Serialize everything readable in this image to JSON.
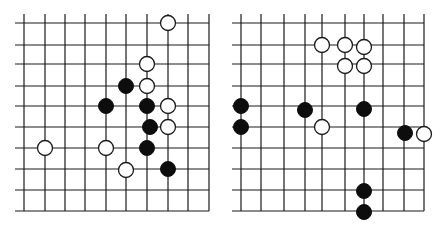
{
  "background": "#ffffff",
  "line_color": "#1a1a1a",
  "black_color": "#0d0d0d",
  "white_color": "#ffffff",
  "stone_radius": 7.5,
  "boards": [
    {
      "name": "left-board",
      "x_lines": [
        24,
        45,
        65,
        85,
        106,
        126,
        147,
        168,
        188,
        209
      ],
      "y_lines": [
        23,
        45,
        64,
        86,
        106,
        127,
        148,
        169,
        190,
        211
      ],
      "h_line_x_extent": [
        15,
        209
      ],
      "v_line_y_extent": [
        14,
        211
      ],
      "stones": [
        {
          "color": "white",
          "x": 168,
          "y": 23
        },
        {
          "color": "white",
          "x": 147,
          "y": 64
        },
        {
          "color": "black",
          "x": 126,
          "y": 86
        },
        {
          "color": "white",
          "x": 147,
          "y": 86
        },
        {
          "color": "black",
          "x": 106,
          "y": 106
        },
        {
          "color": "black",
          "x": 147,
          "y": 106
        },
        {
          "color": "white",
          "x": 168,
          "y": 106
        },
        {
          "color": "black",
          "x": 150,
          "y": 127
        },
        {
          "color": "white",
          "x": 168,
          "y": 127
        },
        {
          "color": "white",
          "x": 45,
          "y": 148
        },
        {
          "color": "white",
          "x": 106,
          "y": 148
        },
        {
          "color": "black",
          "x": 147,
          "y": 148
        },
        {
          "color": "white",
          "x": 126,
          "y": 170
        },
        {
          "color": "black",
          "x": 168,
          "y": 169
        }
      ]
    },
    {
      "name": "right-board",
      "x_lines": [
        241,
        261,
        284,
        305,
        322,
        345,
        364,
        383,
        404,
        424
      ],
      "y_lines": [
        23,
        45,
        64,
        86,
        106,
        127,
        148,
        169,
        190,
        211
      ],
      "h_line_x_extent": [
        232,
        424
      ],
      "v_line_y_extent": [
        14,
        211
      ],
      "stones": [
        {
          "color": "white",
          "x": 322,
          "y": 45
        },
        {
          "color": "white",
          "x": 345,
          "y": 45
        },
        {
          "color": "white",
          "x": 364,
          "y": 47
        },
        {
          "color": "white",
          "x": 345,
          "y": 66
        },
        {
          "color": "white",
          "x": 364,
          "y": 66
        },
        {
          "color": "black",
          "x": 241,
          "y": 106
        },
        {
          "color": "black",
          "x": 241,
          "y": 127
        },
        {
          "color": "black",
          "x": 305,
          "y": 110
        },
        {
          "color": "black",
          "x": 364,
          "y": 109
        },
        {
          "color": "white",
          "x": 322,
          "y": 127
        },
        {
          "color": "black",
          "x": 405,
          "y": 133
        },
        {
          "color": "white",
          "x": 424,
          "y": 134
        },
        {
          "color": "black",
          "x": 364,
          "y": 191
        },
        {
          "color": "black",
          "x": 364,
          "y": 212
        }
      ]
    }
  ]
}
